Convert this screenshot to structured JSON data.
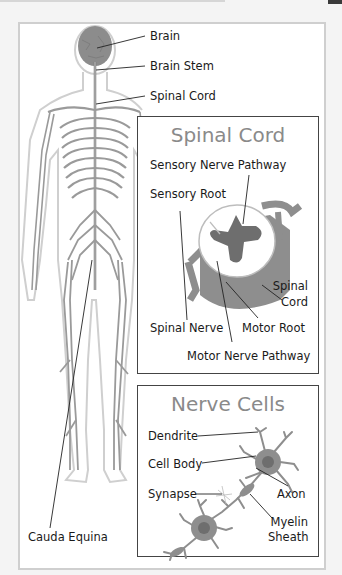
{
  "diagram": {
    "body_labels": {
      "brain": "Brain",
      "brain_stem": "Brain Stem",
      "spinal_cord": "Spinal Cord",
      "cauda_equina": "Cauda Equina"
    },
    "spinal_cord_panel": {
      "title": "Spinal Cord",
      "labels": {
        "sensory_nerve_pathway": "Sensory Nerve Pathway",
        "sensory_root": "Sensory Root",
        "spinal_cord_line1": "Spinal",
        "spinal_cord_line2": "Cord",
        "spinal_nerve": "Spinal Nerve",
        "motor_root": "Motor Root",
        "motor_nerve_pathway": "Motor Nerve Pathway"
      }
    },
    "nerve_cells_panel": {
      "title": "Nerve Cells",
      "labels": {
        "dendrite": "Dendrite",
        "cell_body": "Cell Body",
        "synapse": "Synapse",
        "axon": "Axon",
        "myelin_line1": "Myelin",
        "myelin_line2": "Sheath"
      }
    },
    "colors": {
      "tissue_dark": "#6e6e6e",
      "tissue_mid": "#8c8c8c",
      "tissue_light": "#a8a8a8",
      "outline": "#c8c8c8",
      "title_gray": "#8a8a8a"
    }
  }
}
